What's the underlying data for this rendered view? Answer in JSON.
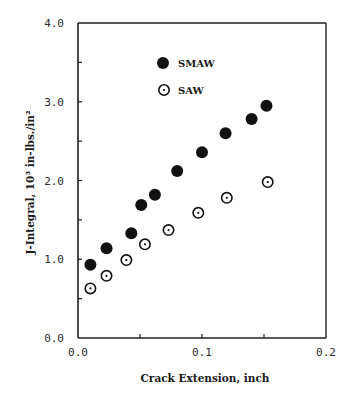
{
  "chart_data": {
    "type": "scatter",
    "title": "",
    "xlabel": "Crack Extension, inch",
    "ylabel": "J-Integral, 10³ in-lbs./in²",
    "xlim": [
      0.0,
      0.2
    ],
    "ylim": [
      0.0,
      4.0
    ],
    "x_ticks": [
      0.0,
      0.05,
      0.1,
      0.15,
      0.2
    ],
    "x_tick_labels": [
      {
        "value": 0.0,
        "label": "0.0"
      },
      {
        "value": 0.1,
        "label": "0.1"
      },
      {
        "value": 0.2,
        "label": "0.2"
      }
    ],
    "y_ticks": [
      0.0,
      0.5,
      1.0,
      1.5,
      2.0,
      2.5,
      3.0,
      3.5,
      4.0
    ],
    "y_tick_labels": [
      {
        "value": 0.0,
        "label": "0.0"
      },
      {
        "value": 1.0,
        "label": "1.0"
      },
      {
        "value": 2.0,
        "label": "2.0"
      },
      {
        "value": 3.0,
        "label": "3.0"
      },
      {
        "value": 4.0,
        "label": "4.0"
      }
    ],
    "grid": false,
    "legend_position": "top-center",
    "series": [
      {
        "name": "SMAW",
        "marker": "filled-circle",
        "color": "#111111",
        "x": [
          0.01,
          0.023,
          0.043,
          0.051,
          0.062,
          0.08,
          0.1,
          0.119,
          0.14,
          0.152
        ],
        "y": [
          0.93,
          1.14,
          1.33,
          1.69,
          1.82,
          2.12,
          2.36,
          2.6,
          2.78,
          2.95
        ]
      },
      {
        "name": "SAW",
        "marker": "open-circle-dot",
        "color": "#111111",
        "x": [
          0.01,
          0.023,
          0.039,
          0.054,
          0.073,
          0.097,
          0.12,
          0.153
        ],
        "y": [
          0.63,
          0.79,
          0.99,
          1.19,
          1.37,
          1.59,
          1.78,
          1.98
        ]
      }
    ]
  }
}
